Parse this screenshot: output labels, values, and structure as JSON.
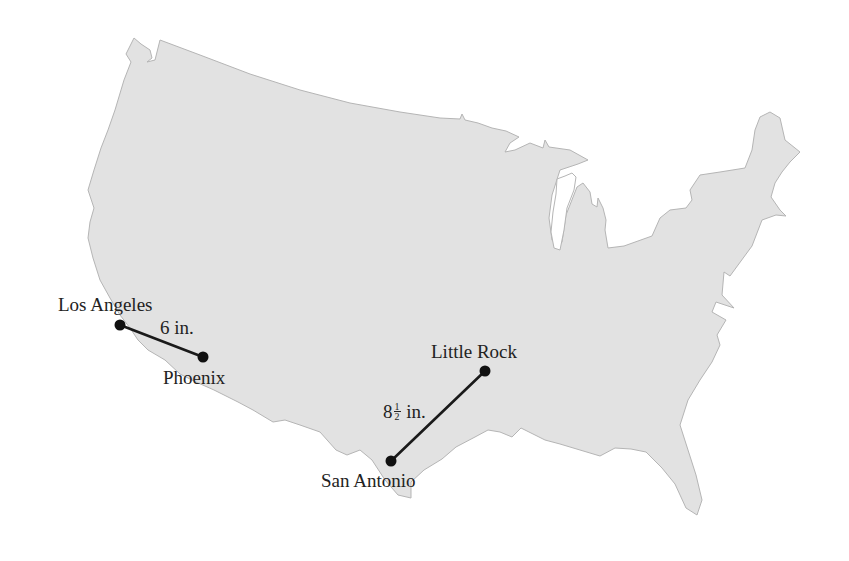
{
  "figure": {
    "type": "map",
    "region": "Contiguous United States",
    "land_color": "#e2e2e2",
    "outline_color": "#b5b5b5",
    "route_color": "#1a1a1a"
  },
  "cities": [
    {
      "name": "Los Angeles",
      "x": 120,
      "y": 325
    },
    {
      "name": "Phoenix",
      "x": 203,
      "y": 357
    },
    {
      "name": "Little Rock",
      "x": 485,
      "y": 371
    },
    {
      "name": "San Antonio",
      "x": 391,
      "y": 461
    }
  ],
  "routes": [
    {
      "from": "Los Angeles",
      "to": "Phoenix",
      "label_whole": "6",
      "label_unit": "in."
    },
    {
      "from": "San Antonio",
      "to": "Little Rock",
      "label_whole": "8",
      "label_frac_num": "1",
      "label_frac_den": "2",
      "label_unit": "in."
    }
  ]
}
